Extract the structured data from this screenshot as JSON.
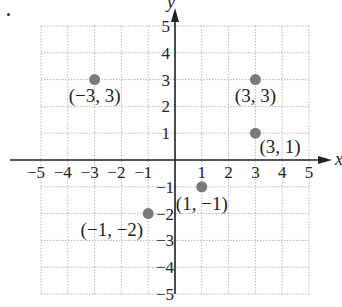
{
  "chart_data": {
    "type": "scatter",
    "title": "",
    "xlabel": "x",
    "ylabel": "y",
    "xlim": [
      -5,
      5
    ],
    "ylim": [
      -5,
      5
    ],
    "grid": true,
    "grid_style": "dotted",
    "x_ticks": [
      "-5",
      "-4",
      "-3",
      "-2",
      "-1",
      "1",
      "2",
      "3",
      "4",
      "5"
    ],
    "y_ticks": [
      "5",
      "4",
      "3",
      "2",
      "1",
      "-1",
      "-2",
      "-3",
      "-4",
      "-5"
    ],
    "point_color": "#7a7a7a",
    "points": [
      {
        "x": -3,
        "y": 3,
        "label": "(−3, 3)"
      },
      {
        "x": 3,
        "y": 3,
        "label": "(3, 3)"
      },
      {
        "x": 3,
        "y": 1,
        "label": "(3, 1)"
      },
      {
        "x": 1,
        "y": -1,
        "label": "(1, −1)"
      },
      {
        "x": -1,
        "y": -2,
        "label": "(−1, −2)"
      }
    ]
  }
}
